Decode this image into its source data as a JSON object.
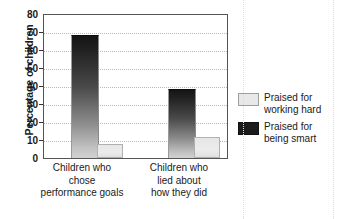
{
  "chart_data": {
    "type": "bar",
    "title": "",
    "xlabel": "",
    "ylabel": "Percentage of children",
    "ylim": [
      0,
      80
    ],
    "yticks": [
      0,
      10,
      20,
      30,
      40,
      50,
      60,
      70,
      80
    ],
    "ytick_labels": [
      "0",
      "10",
      "20",
      "30",
      "40",
      "50",
      "60",
      "70",
      "80"
    ],
    "grid": true,
    "legend_position": "right",
    "categories": [
      "Children who chose performance goals",
      "Children who lied about how they did"
    ],
    "category_lines": [
      [
        "Children who",
        "chose",
        "performance goals"
      ],
      [
        "Children who",
        "lied about",
        "how they did"
      ]
    ],
    "series": [
      {
        "name": "Praised for working hard",
        "name_lines": [
          "Praised for",
          "working hard"
        ],
        "color": "#e8e8e8",
        "values": [
          8,
          12
        ]
      },
      {
        "name": "Praised for being smart",
        "name_lines": [
          "Praised for",
          "being smart"
        ],
        "color": "#1b1b1b",
        "values": [
          68,
          38
        ]
      }
    ]
  },
  "axis": {
    "y_title": "Percentage of children"
  },
  "legend": {
    "items": [
      {
        "line1": "Praised for",
        "line2": "working hard"
      },
      {
        "line1": "Praised for",
        "line2": "being smart"
      }
    ]
  },
  "x_labels": [
    {
      "line1": "Children who",
      "line2": "chose",
      "line3": "performance goals"
    },
    {
      "line1": "Children who",
      "line2": "lied about",
      "line3": "how they did"
    }
  ],
  "y_ticks": [
    "80",
    "70",
    "60",
    "50",
    "40",
    "30",
    "20",
    "10",
    "0"
  ]
}
